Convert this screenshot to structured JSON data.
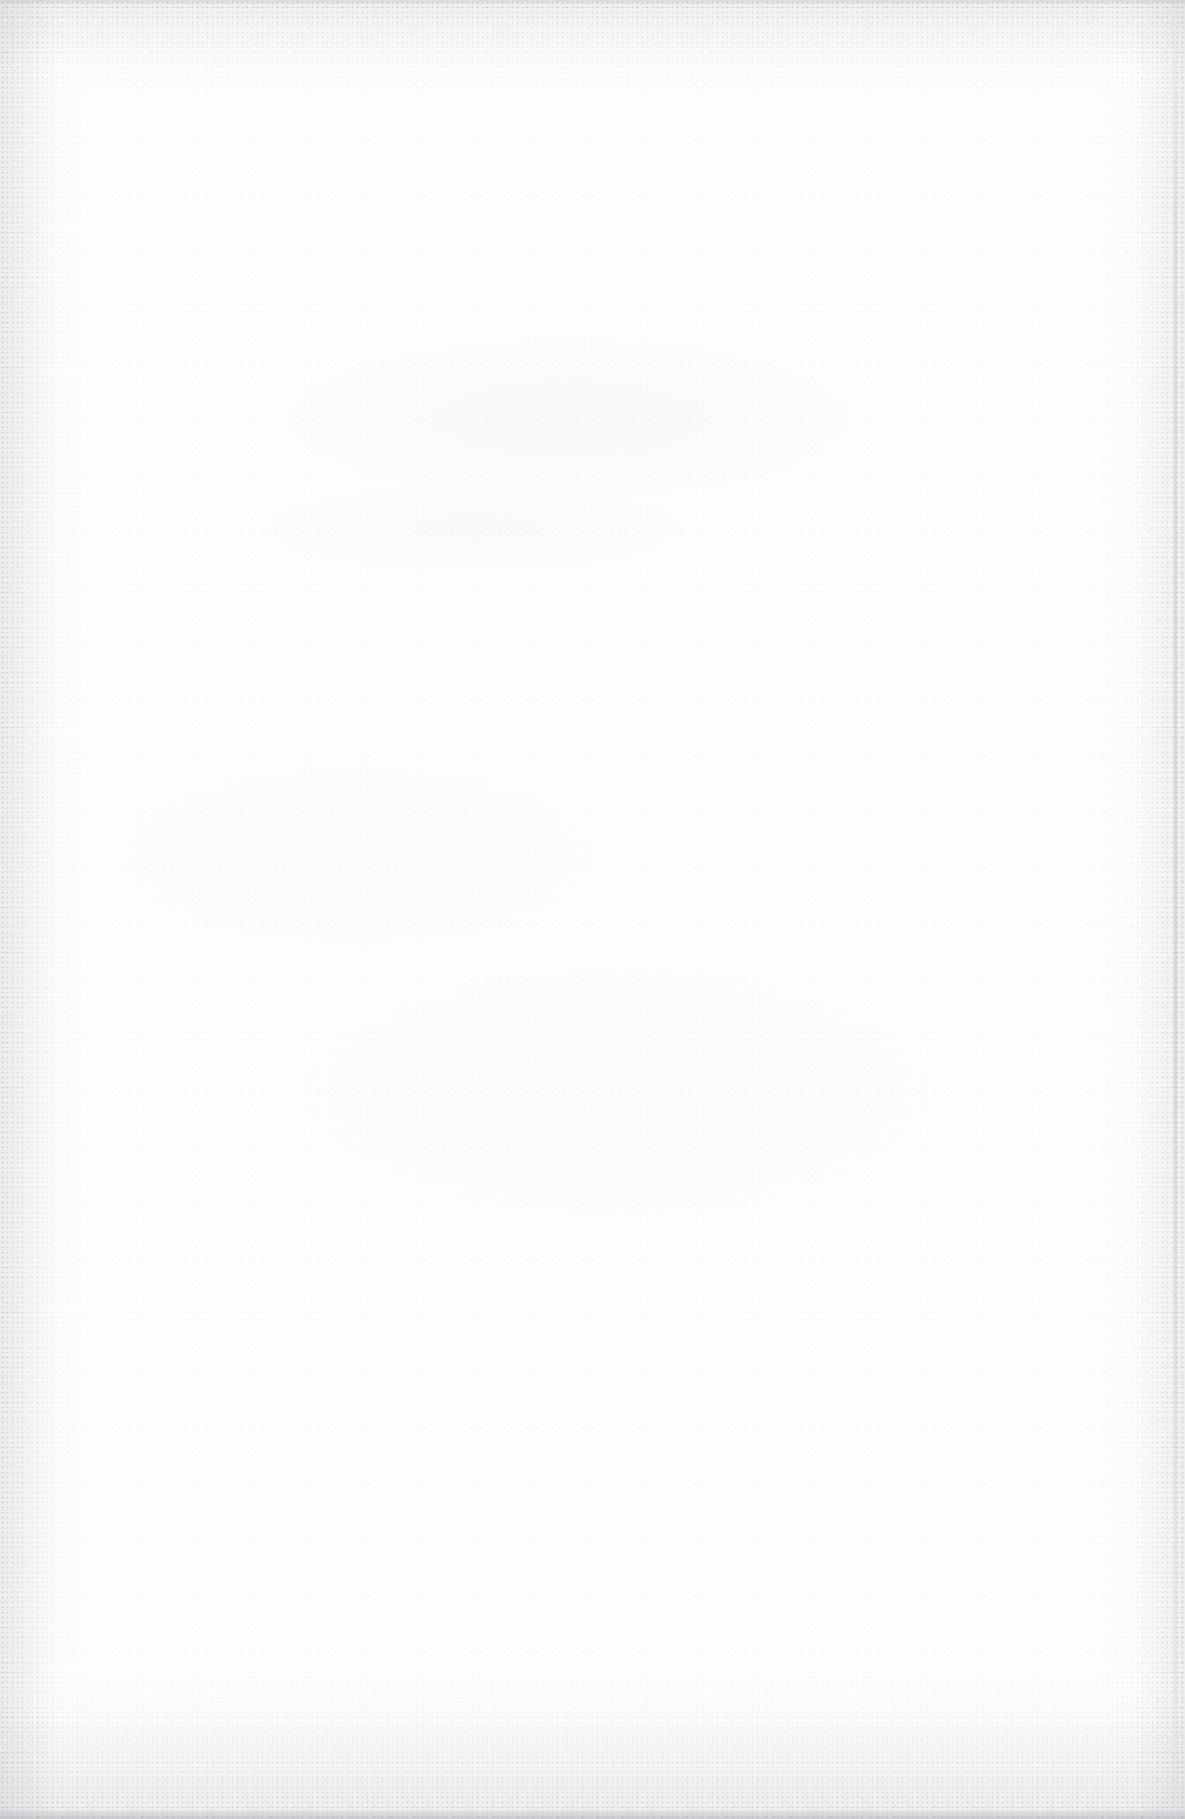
{
  "document": {
    "kind": "scanned-page",
    "page_width": 1185,
    "page_height": 1819,
    "has_visible_text": false,
    "visible_text": "",
    "description_label": "",
    "background_color": "#fdfdfd",
    "edge_noise_color": "#8a8a92",
    "bottom_strip_color": "#b0b0b8",
    "right_margin_line_color": "#8c8c96"
  },
  "content": {
    "blocks": [],
    "headings": [],
    "paragraphs": [],
    "figures": [],
    "tables": [],
    "page_number": ""
  }
}
